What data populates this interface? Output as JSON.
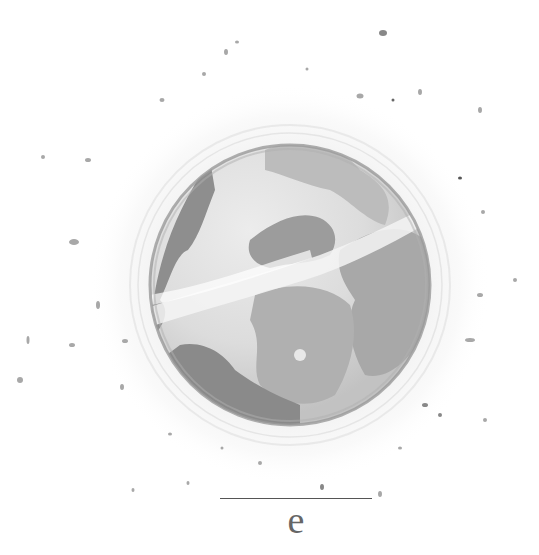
{
  "illustration": {
    "subject": "watercolor-planet",
    "palette": {
      "background": "#ffffff",
      "ocean_light": "#e4e4e4",
      "land_mid": "#b4b4b4",
      "land_dark": "#8e8e8e",
      "rim": "#9a9a9a",
      "halo": "#eeeeee",
      "speckle": "#a8a8a8"
    }
  },
  "caption": {
    "letter": "e"
  }
}
